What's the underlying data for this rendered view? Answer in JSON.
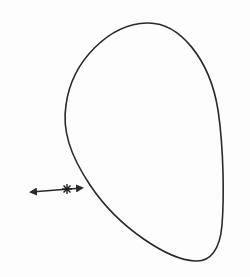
{
  "diagram": {
    "colors": {
      "background": "#fdfdfd",
      "stroke": "#2a2a2a"
    },
    "closed_curve": {
      "top": [
        147,
        23
      ],
      "left": [
        65,
        110
      ],
      "bottom": [
        195,
        261
      ],
      "right": [
        223,
        170
      ]
    },
    "arrow": {
      "start": [
        29,
        192
      ],
      "end": [
        84,
        188
      ],
      "marker": "*",
      "marker_position": [
        67,
        189
      ]
    }
  }
}
